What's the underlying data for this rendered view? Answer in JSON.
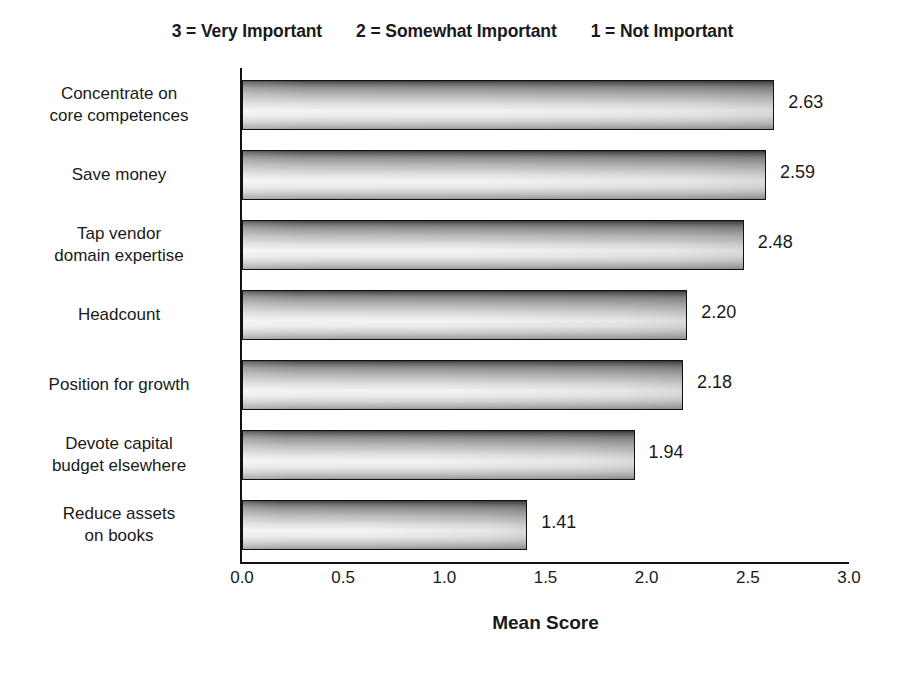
{
  "chart_data": {
    "type": "bar",
    "orientation": "horizontal",
    "title_segments": [
      "3 = Very Important",
      "2 = Somewhat Important",
      "1 = Not Important"
    ],
    "categories": [
      "Concentrate on core competences",
      "Save money",
      "Tap vendor domain expertise",
      "Headcount",
      "Position for growth",
      "Devote capital budget elsewhere",
      "Reduce assets on books"
    ],
    "category_lines": [
      [
        "Concentrate on",
        "core competences"
      ],
      [
        "Save money"
      ],
      [
        "Tap vendor",
        "domain expertise"
      ],
      [
        "Headcount"
      ],
      [
        "Position for growth"
      ],
      [
        "Devote capital",
        "budget elsewhere"
      ],
      [
        "Reduce assets",
        "on books"
      ]
    ],
    "values": [
      2.63,
      2.59,
      2.48,
      2.2,
      2.18,
      1.94,
      1.41
    ],
    "value_labels": [
      "2.63",
      "2.59",
      "2.48",
      "2.20",
      "2.18",
      "1.94",
      "1.41"
    ],
    "xlabel": "Mean Score",
    "ylabel": "",
    "xlim": [
      0,
      3
    ],
    "xticks": [
      0,
      0.5,
      1,
      1.5,
      2,
      2.5,
      3
    ],
    "xtick_labels": [
      "0.0",
      "0.5",
      "1.0",
      "1.5",
      "2.0",
      "2.5",
      "3.0"
    ],
    "grid": false,
    "legend": null,
    "bar_style": "gradient-gray",
    "colors": {
      "axis": "#111111",
      "text": "#1a1a1a",
      "background": "#ffffff",
      "bar_dark": "#3a3a3a",
      "bar_light": "#f4f4f4"
    }
  }
}
